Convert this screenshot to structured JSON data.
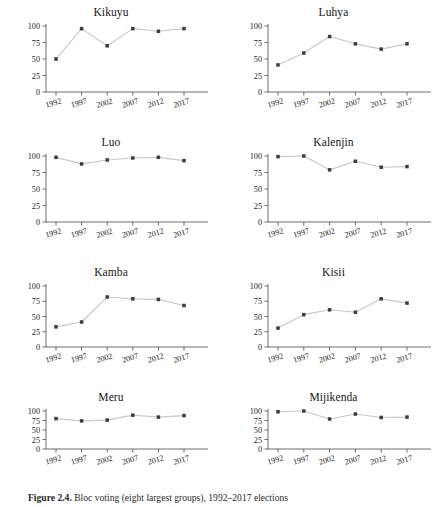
{
  "figure": {
    "caption_label": "Figure 2.4.",
    "caption_text": "Bloc voting (eight largest groups), 1992–2017 elections",
    "background": "#ffffff",
    "line_color": "#c8c8c8",
    "marker_color": "#3c3c3c",
    "axis_color": "#4a4a4a"
  },
  "chart_data": {
    "type": "line",
    "title": "Bloc voting (eight largest groups), 1992–2017 elections",
    "xlabel": "",
    "ylabel": "",
    "categories": [
      "1992",
      "1997",
      "2002",
      "2007",
      "2012",
      "2017"
    ],
    "x": [
      1992,
      1997,
      2002,
      2007,
      2012,
      2017
    ],
    "xlim": [
      1990,
      2019
    ],
    "ylim": [
      0,
      100
    ],
    "yticks": [
      0,
      25,
      50,
      75,
      100
    ],
    "xticks": [
      "1992",
      "1997",
      "2002",
      "2007",
      "2012",
      "2017"
    ],
    "grid": false,
    "legend": "none",
    "layout": "2 columns x 4 rows small multiples",
    "panels": [
      {
        "name": "Kikuyu",
        "values": [
          50,
          96,
          70,
          96,
          92,
          96
        ]
      },
      {
        "name": "Luhya",
        "values": [
          41,
          59,
          84,
          73,
          65,
          73
        ]
      },
      {
        "name": "Luo",
        "values": [
          98,
          88,
          94,
          97,
          98,
          93
        ]
      },
      {
        "name": "Kalenjin",
        "values": [
          99,
          100,
          79,
          92,
          83,
          84
        ]
      },
      {
        "name": "Kamba",
        "values": [
          33,
          41,
          82,
          79,
          78,
          68
        ]
      },
      {
        "name": "Kisii",
        "values": [
          31,
          53,
          61,
          57,
          79,
          72
        ]
      },
      {
        "name": "Meru",
        "values": [
          80,
          74,
          76,
          89,
          84,
          88
        ]
      },
      {
        "name": "Mijikenda",
        "values": [
          98,
          100,
          79,
          92,
          83,
          84
        ]
      }
    ]
  }
}
